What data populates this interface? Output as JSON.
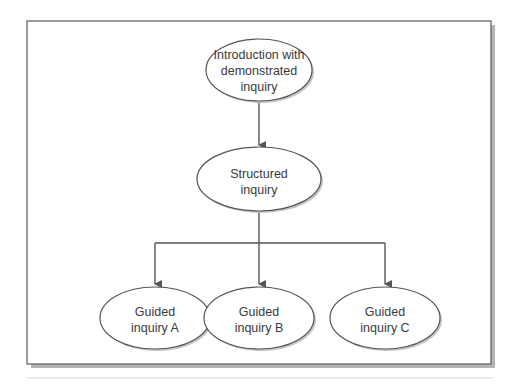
{
  "diagram": {
    "type": "flowchart",
    "nodes": [
      {
        "id": "intro",
        "lines": [
          "Introduction with",
          "demonstrated",
          "inquiry"
        ]
      },
      {
        "id": "structured",
        "lines": [
          "Structured",
          "inquiry"
        ]
      },
      {
        "id": "guidedA",
        "lines": [
          "Guided",
          "inquiry A"
        ]
      },
      {
        "id": "guidedB",
        "lines": [
          "Guided",
          "inquiry B"
        ]
      },
      {
        "id": "guidedC",
        "lines": [
          "Guided",
          "inquiry C"
        ]
      }
    ],
    "edges": [
      {
        "from": "intro",
        "to": "structured"
      },
      {
        "from": "structured",
        "to": "guidedA"
      },
      {
        "from": "structured",
        "to": "guidedB"
      },
      {
        "from": "structured",
        "to": "guidedC"
      }
    ]
  },
  "colors": {
    "stroke": "#555555",
    "text": "#3a3a3a",
    "shadow": "#bdbdbd"
  }
}
